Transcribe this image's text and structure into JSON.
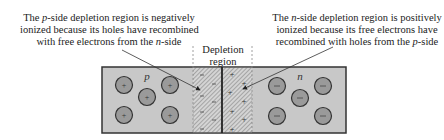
{
  "captions": {
    "left": {
      "line1_pre": "The ",
      "line1_em": "p",
      "line1_post": "-side depletion region is negatively",
      "line2": "ionized because its holes have recombined",
      "line3_pre": "with free electrons from the ",
      "line3_em": "n",
      "line3_post": "-side"
    },
    "right": {
      "line1_pre": "The ",
      "line1_em": "n",
      "line1_post": "-side depletion region is positively",
      "line2": "ionized because its free electrons have",
      "line3_pre": "recombined with holes from the ",
      "line3_em": "p",
      "line3_post": "-side"
    }
  },
  "depletion_label": {
    "line1": "Depletion",
    "line2": "region"
  },
  "regions": {
    "p_label": "p",
    "n_label": "n"
  },
  "ion_symbols": {
    "p_side_carrier": "+",
    "n_side_carrier": "−",
    "p_depletion_charge": "−",
    "n_depletion_charge": "+"
  },
  "colors": {
    "bulk_fill": "#c8c8c8",
    "circle_fill": "#9a9a9a",
    "outline": "#333333",
    "hatch": "#777777"
  }
}
